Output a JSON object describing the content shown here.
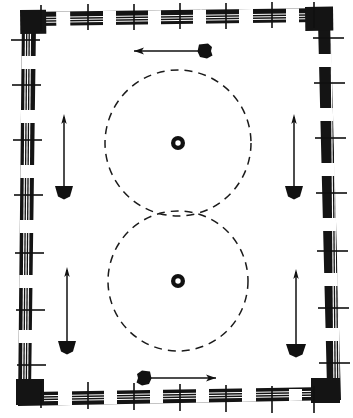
{
  "figure": {
    "title": "Reinforced formwork plan with two dashed circular outlines and directional movement arrows",
    "type": "engineering-line-drawing",
    "width": 353,
    "height": 418,
    "background_color": "#ffffff",
    "ink_color": "#111111"
  },
  "frame": {
    "name": "hatched-rebar-frame",
    "style": "thick band, dashed dark segments, three thin white parallel lines, perpendicular tie ticks",
    "band_color": "#141414",
    "gap_color": "#ffffff",
    "band_thickness": 13,
    "tick_count_top": 7,
    "tick_count_bottom": 7,
    "tick_count_left": 6,
    "tick_count_right": 6,
    "corners": "solid-filled",
    "outline_points": "slightly skewed quadrilateral (hand-drafted)"
  },
  "circles": [
    {
      "name": "upper-dashed-circle",
      "cx": 178,
      "cy": 143,
      "r": 73,
      "stroke": "#1b1b1b",
      "dash": "8 6",
      "center_marker": "donut"
    },
    {
      "name": "lower-dashed-circle",
      "cx": 178,
      "cy": 281,
      "r": 70,
      "stroke": "#1b1b1b",
      "dash": "8 6",
      "center_marker": "donut"
    }
  ],
  "center_markers": [
    {
      "name": "upper-circle-center-donut",
      "cx": 178,
      "cy": 143,
      "outer_r": 7,
      "inner_r": 2.6
    },
    {
      "name": "lower-circle-center-donut",
      "cx": 178,
      "cy": 281,
      "outer_r": 7,
      "inner_r": 2.6
    }
  ],
  "arrows": [
    {
      "name": "top-horizontal-arrow",
      "orientation": "horizontal",
      "direction": "left",
      "x1": 206,
      "y1": 51,
      "x2": 133,
      "y2": 51,
      "head_end": "thin-arrowhead-left",
      "tail_end": "solid-blob-right"
    },
    {
      "name": "bottom-horizontal-arrow",
      "orientation": "horizontal",
      "direction": "right",
      "x1": 140,
      "y1": 378,
      "x2": 216,
      "y2": 378,
      "head_end": "thin-arrowhead-right",
      "tail_end": "solid-blob-left"
    },
    {
      "name": "upper-left-vertical-arrow",
      "orientation": "vertical",
      "direction": "up",
      "x1": 64,
      "y1": 193,
      "x2": 64,
      "y2": 115,
      "head_end": "thin-arrowhead-up",
      "tail_end": "solid-blob-bottom"
    },
    {
      "name": "upper-right-vertical-arrow",
      "orientation": "vertical",
      "direction": "up",
      "x1": 294,
      "y1": 193,
      "x2": 294,
      "y2": 115,
      "head_end": "thin-arrowhead-up",
      "tail_end": "solid-blob-bottom"
    },
    {
      "name": "lower-left-vertical-arrow",
      "orientation": "vertical",
      "direction": "up",
      "x1": 67,
      "y1": 348,
      "x2": 67,
      "y2": 268,
      "head_end": "thin-arrowhead-up",
      "tail_end": "solid-blob-bottom"
    },
    {
      "name": "lower-right-vertical-arrow",
      "orientation": "vertical",
      "direction": "up",
      "x1": 296,
      "y1": 352,
      "x2": 296,
      "y2": 270,
      "head_end": "thin-arrowhead-up",
      "tail_end": "solid-blob-bottom"
    }
  ],
  "labels": {
    "caption": ""
  }
}
